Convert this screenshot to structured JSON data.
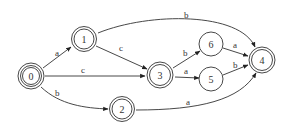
{
  "diagram": {
    "type": "finite-automaton",
    "nodes": [
      {
        "id": "0",
        "label": "0",
        "x": 31,
        "y": 76,
        "kind": "initial-accepting"
      },
      {
        "id": "1",
        "label": "1",
        "x": 84,
        "y": 39,
        "kind": "accepting"
      },
      {
        "id": "2",
        "label": "2",
        "x": 122,
        "y": 109,
        "kind": "accepting"
      },
      {
        "id": "3",
        "label": "3",
        "x": 160,
        "y": 75,
        "kind": "accepting"
      },
      {
        "id": "4",
        "label": "4",
        "x": 262,
        "y": 60,
        "kind": "accepting"
      },
      {
        "id": "5",
        "label": "5",
        "x": 211,
        "y": 79,
        "kind": "normal"
      },
      {
        "id": "6",
        "label": "6",
        "x": 211,
        "y": 44,
        "kind": "normal"
      }
    ],
    "edges": [
      {
        "from": "0",
        "to": "1",
        "label": "a"
      },
      {
        "from": "0",
        "to": "3",
        "label": "c"
      },
      {
        "from": "0",
        "to": "2",
        "label": "b"
      },
      {
        "from": "1",
        "to": "3",
        "label": "c"
      },
      {
        "from": "1",
        "to": "4",
        "label": "b"
      },
      {
        "from": "2",
        "to": "4",
        "label": "a"
      },
      {
        "from": "3",
        "to": "6",
        "label": "b"
      },
      {
        "from": "3",
        "to": "5",
        "label": "a"
      },
      {
        "from": "6",
        "to": "4",
        "label": "a"
      },
      {
        "from": "5",
        "to": "4",
        "label": "b"
      }
    ]
  }
}
